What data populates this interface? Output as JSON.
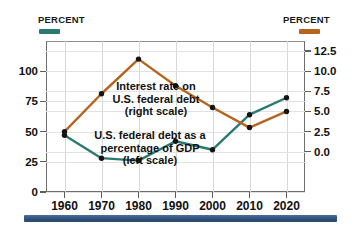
{
  "header": {
    "left_percent_label": "PERCENT",
    "right_percent_label": "PERCENT",
    "left_swatch_color": "#2a7a72",
    "right_swatch_color": "#b5651d"
  },
  "chart_data": {
    "type": "line",
    "title": "",
    "xlabel": "",
    "grid": true,
    "legend_position": "inline-annotations",
    "x": [
      1960,
      1970,
      1980,
      1990,
      2000,
      2010,
      2020
    ],
    "xtick_labels": [
      "1960",
      "1970",
      "1980",
      "1990",
      "2000",
      "2010",
      "2020"
    ],
    "left_axis": {
      "label": "PERCENT",
      "ylim": [
        0,
        125
      ],
      "ticks": [
        0,
        25,
        50,
        75,
        100
      ],
      "tick_labels": [
        "0",
        "25",
        "50",
        "75",
        "100"
      ]
    },
    "right_axis": {
      "label": "PERCENT",
      "ylim": [
        -5.0,
        13.75
      ],
      "ticks": [
        0.0,
        2.5,
        5.0,
        7.5,
        10.0,
        12.5
      ],
      "tick_labels": [
        "0.0",
        "2.5",
        "5.0",
        "7.5",
        "10.0",
        "12.5"
      ]
    },
    "series": [
      {
        "name": "U.S. federal debt as a percentage of GDP (left scale)",
        "axis": "left",
        "color": "#2a7a72",
        "marker": "circle",
        "values": [
          47,
          28,
          26,
          42,
          35,
          64,
          78
        ]
      },
      {
        "name": "Interest rate on U.S. federal debt (right scale)",
        "axis": "right",
        "color": "#b5651d",
        "marker": "circle",
        "values": [
          2.5,
          7.2,
          11.5,
          8.2,
          5.5,
          3.0,
          5.0
        ]
      }
    ],
    "annotations": [
      {
        "id": "interest-rate",
        "lines": [
          "Interest rate on",
          "U.S. federal debt",
          "(right scale)"
        ]
      },
      {
        "id": "debt-gdp",
        "lines": [
          "U.S. federal debt as a",
          "percentage of GDP",
          "(left scale)"
        ]
      }
    ]
  }
}
